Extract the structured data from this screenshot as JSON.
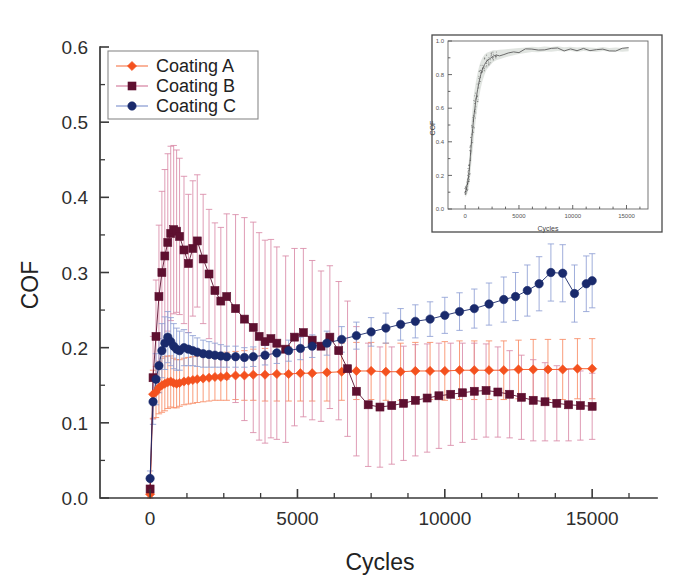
{
  "figure": {
    "background_color": "#ffffff",
    "axis_color": "#3a3a3a"
  },
  "chart_data": {
    "type": "scatter",
    "title": "",
    "xlabel": "Cycles",
    "ylabel": "COF",
    "xlim": [
      -1700,
      17200
    ],
    "ylim": [
      0.0,
      0.6
    ],
    "xticks": [
      0,
      5000,
      10000,
      15000
    ],
    "xticklabels": [
      "0",
      "5000",
      "10000",
      "15000"
    ],
    "xminor_step": 1250,
    "yticks": [
      0.0,
      0.1,
      0.2,
      0.3,
      0.4,
      0.5,
      0.6
    ],
    "yticklabels": [
      "0.0",
      "0.1",
      "0.2",
      "0.3",
      "0.4",
      "0.5",
      "0.6"
    ],
    "yminor_step": 0.05,
    "grid": false,
    "errorbars": true,
    "legend_position": "upper-left",
    "legend": [
      "Coating A",
      "Coating B",
      "Coating C"
    ],
    "series": [
      {
        "name": "Coating A",
        "color": "#f4511e",
        "errorbar_color": "#f88a63",
        "marker": "diamond",
        "x": [
          0,
          100,
          200,
          300,
          400,
          500,
          600,
          700,
          800,
          900,
          1000,
          1150,
          1300,
          1450,
          1600,
          1800,
          2000,
          2200,
          2400,
          2600,
          2900,
          3200,
          3500,
          3900,
          4300,
          4700,
          5100,
          5500,
          6000,
          6500,
          7000,
          7500,
          8000,
          8500,
          9000,
          9500,
          10000,
          10500,
          11000,
          11500,
          12000,
          12500,
          13000,
          13500,
          14000,
          14500,
          15000
        ],
        "y": [
          0.005,
          0.138,
          0.141,
          0.147,
          0.15,
          0.152,
          0.154,
          0.155,
          0.153,
          0.152,
          0.153,
          0.155,
          0.156,
          0.157,
          0.158,
          0.159,
          0.16,
          0.161,
          0.161,
          0.162,
          0.163,
          0.163,
          0.164,
          0.164,
          0.165,
          0.165,
          0.166,
          0.166,
          0.167,
          0.168,
          0.169,
          0.169,
          0.168,
          0.168,
          0.169,
          0.169,
          0.169,
          0.17,
          0.17,
          0.17,
          0.17,
          0.171,
          0.171,
          0.171,
          0.171,
          0.172,
          0.172
        ],
        "yerr": [
          0.01,
          0.032,
          0.034,
          0.035,
          0.036,
          0.036,
          0.035,
          0.034,
          0.033,
          0.032,
          0.031,
          0.031,
          0.031,
          0.031,
          0.031,
          0.031,
          0.031,
          0.031,
          0.031,
          0.032,
          0.032,
          0.033,
          0.034,
          0.035,
          0.036,
          0.036,
          0.037,
          0.037,
          0.038,
          0.038,
          0.038,
          0.038,
          0.038,
          0.038,
          0.038,
          0.038,
          0.039,
          0.039,
          0.039,
          0.039,
          0.039,
          0.039,
          0.04,
          0.04,
          0.04,
          0.04,
          0.04
        ]
      },
      {
        "name": "Coating B",
        "color": "#5e1030",
        "errorbar_color": "#d98aa8",
        "marker": "square",
        "x": [
          0,
          100,
          200,
          300,
          400,
          500,
          600,
          700,
          800,
          900,
          1000,
          1150,
          1300,
          1450,
          1600,
          1800,
          2000,
          2200,
          2400,
          2600,
          2900,
          3200,
          3500,
          3700,
          3900,
          4100,
          4300,
          4600,
          4900,
          5200,
          5500,
          5800,
          6100,
          6400,
          6700,
          7000,
          7400,
          7800,
          8200,
          8600,
          9000,
          9400,
          9800,
          10200,
          10600,
          11000,
          11400,
          11800,
          12200,
          12600,
          13000,
          13400,
          13800,
          14200,
          14600,
          15000
        ],
        "y": [
          0.012,
          0.16,
          0.215,
          0.268,
          0.3,
          0.322,
          0.34,
          0.352,
          0.357,
          0.355,
          0.348,
          0.33,
          0.312,
          0.332,
          0.342,
          0.318,
          0.298,
          0.276,
          0.262,
          0.268,
          0.252,
          0.238,
          0.227,
          0.215,
          0.208,
          0.212,
          0.206,
          0.198,
          0.214,
          0.22,
          0.21,
          0.202,
          0.214,
          0.196,
          0.172,
          0.142,
          0.124,
          0.121,
          0.123,
          0.126,
          0.13,
          0.133,
          0.136,
          0.138,
          0.14,
          0.142,
          0.143,
          0.141,
          0.138,
          0.134,
          0.13,
          0.128,
          0.126,
          0.124,
          0.123,
          0.122
        ],
        "yerr": [
          0.012,
          0.055,
          0.075,
          0.095,
          0.108,
          0.115,
          0.118,
          0.116,
          0.112,
          0.108,
          0.104,
          0.098,
          0.092,
          0.09,
          0.088,
          0.086,
          0.086,
          0.09,
          0.098,
          0.11,
          0.125,
          0.135,
          0.14,
          0.138,
          0.135,
          0.132,
          0.128,
          0.124,
          0.118,
          0.112,
          0.106,
          0.1,
          0.095,
          0.092,
          0.09,
          0.086,
          0.082,
          0.08,
          0.078,
          0.076,
          0.074,
          0.072,
          0.07,
          0.068,
          0.066,
          0.064,
          0.062,
          0.06,
          0.058,
          0.056,
          0.054,
          0.052,
          0.05,
          0.048,
          0.046,
          0.044
        ]
      },
      {
        "name": "Coating C",
        "color": "#1a2a6c",
        "errorbar_color": "#8f9fd4",
        "marker": "circle",
        "x": [
          0,
          100,
          200,
          300,
          400,
          500,
          600,
          700,
          800,
          900,
          1000,
          1150,
          1300,
          1450,
          1600,
          1800,
          2000,
          2200,
          2400,
          2600,
          2900,
          3200,
          3500,
          3900,
          4300,
          4700,
          5100,
          5500,
          6000,
          6500,
          7000,
          7500,
          8000,
          8500,
          9000,
          9500,
          10000,
          10500,
          11000,
          11500,
          12000,
          12400,
          12800,
          13200,
          13600,
          14000,
          14400,
          14800,
          15000
        ],
        "y": [
          0.026,
          0.128,
          0.158,
          0.176,
          0.196,
          0.206,
          0.214,
          0.208,
          0.202,
          0.198,
          0.196,
          0.2,
          0.198,
          0.196,
          0.194,
          0.192,
          0.191,
          0.19,
          0.189,
          0.188,
          0.188,
          0.187,
          0.188,
          0.19,
          0.193,
          0.196,
          0.199,
          0.202,
          0.206,
          0.211,
          0.216,
          0.221,
          0.226,
          0.231,
          0.235,
          0.238,
          0.243,
          0.248,
          0.252,
          0.258,
          0.264,
          0.268,
          0.276,
          0.285,
          0.3,
          0.299,
          0.272,
          0.285,
          0.289
        ],
        "yerr": [
          0.01,
          0.03,
          0.034,
          0.036,
          0.036,
          0.035,
          0.034,
          0.032,
          0.03,
          0.028,
          0.026,
          0.024,
          0.022,
          0.02,
          0.019,
          0.018,
          0.017,
          0.016,
          0.015,
          0.014,
          0.014,
          0.013,
          0.013,
          0.013,
          0.014,
          0.014,
          0.015,
          0.015,
          0.016,
          0.017,
          0.018,
          0.019,
          0.02,
          0.021,
          0.022,
          0.023,
          0.024,
          0.025,
          0.026,
          0.028,
          0.03,
          0.032,
          0.034,
          0.036,
          0.038,
          0.038,
          0.038,
          0.037,
          0.036
        ]
      }
    ]
  },
  "inset": {
    "xlabel": "Cycles",
    "ylabel": "COF",
    "xlim": [
      -1600,
      17000
    ],
    "ylim": [
      0.0,
      1.0
    ],
    "xticks": [
      0,
      5000,
      10000,
      15000
    ],
    "xticklabels": [
      "0",
      "5000",
      "10000",
      "15000"
    ],
    "yticks": [
      0.0,
      0.2,
      0.4,
      0.6,
      0.8,
      1.0
    ],
    "yticklabels": [
      "0.0",
      "0.2",
      "0.4",
      "0.6",
      "0.8",
      "1.0"
    ],
    "series_color": "#6b6b6b",
    "band_color": "#c9cfc9",
    "curve": {
      "x": [
        0,
        60,
        120,
        180,
        240,
        300,
        360,
        420,
        480,
        540,
        600,
        700,
        800,
        900,
        1000,
        1150,
        1300,
        1450,
        1600,
        1800,
        2000,
        2200,
        2400,
        2600,
        2900,
        3200,
        3600,
        4000,
        4500,
        5000,
        5600,
        6200,
        6800,
        7400,
        8000,
        8600,
        9200,
        9800,
        10400,
        11000,
        11600,
        12200,
        12800,
        13400,
        14000,
        14600,
        15200
      ],
      "y": [
        0.1,
        0.11,
        0.12,
        0.14,
        0.16,
        0.19,
        0.22,
        0.26,
        0.31,
        0.36,
        0.41,
        0.48,
        0.55,
        0.6,
        0.65,
        0.71,
        0.76,
        0.8,
        0.83,
        0.86,
        0.88,
        0.89,
        0.9,
        0.91,
        0.915,
        0.92,
        0.925,
        0.93,
        0.935,
        0.94,
        0.945,
        0.95,
        0.948,
        0.952,
        0.95,
        0.955,
        0.95,
        0.953,
        0.948,
        0.952,
        0.95,
        0.947,
        0.952,
        0.948,
        0.95,
        0.947,
        0.95
      ],
      "yerr": [
        0.03,
        0.035,
        0.04,
        0.05,
        0.06,
        0.07,
        0.08,
        0.09,
        0.1,
        0.11,
        0.12,
        0.13,
        0.13,
        0.12,
        0.11,
        0.1,
        0.09,
        0.08,
        0.07,
        0.06,
        0.05,
        0.045,
        0.04,
        0.035,
        0.03,
        0.028,
        0.025,
        0.022,
        0.02,
        0.018,
        0.017,
        0.016,
        0.015,
        0.015,
        0.014,
        0.014,
        0.013,
        0.013,
        0.013,
        0.012,
        0.012,
        0.012,
        0.012,
        0.011,
        0.011,
        0.011,
        0.011
      ]
    }
  }
}
